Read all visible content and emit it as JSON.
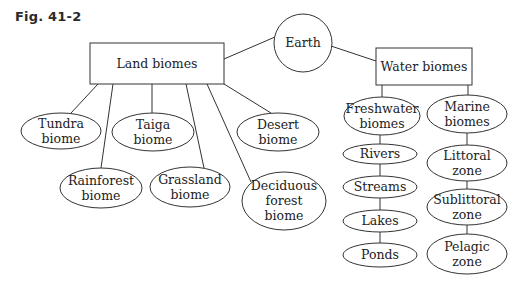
{
  "figure": {
    "label": "Fig. 41-2"
  },
  "diagram": {
    "colors": {
      "stroke": "#333333",
      "text": "#222222",
      "background": "#ffffff"
    },
    "nodes": [
      {
        "id": "earth",
        "shape": "circle",
        "lines": [
          "Earth"
        ],
        "cx": 303,
        "cy": 43,
        "r": 29
      },
      {
        "id": "land",
        "shape": "rect",
        "lines": [
          "Land biomes"
        ],
        "x": 90,
        "y": 43,
        "w": 134,
        "h": 41
      },
      {
        "id": "water",
        "shape": "rect",
        "lines": [
          "Water biomes"
        ],
        "x": 376,
        "y": 48,
        "w": 96,
        "h": 37
      },
      {
        "id": "tundra",
        "shape": "ellipse",
        "lines": [
          "Tundra",
          "biome"
        ],
        "cx": 61,
        "cy": 131,
        "rx": 40,
        "ry": 18
      },
      {
        "id": "taiga",
        "shape": "ellipse",
        "lines": [
          "Taiga",
          "biome"
        ],
        "cx": 153,
        "cy": 132,
        "rx": 41,
        "ry": 19
      },
      {
        "id": "desert",
        "shape": "ellipse",
        "lines": [
          "Desert",
          "biome"
        ],
        "cx": 278,
        "cy": 132,
        "rx": 41,
        "ry": 19
      },
      {
        "id": "rainforest",
        "shape": "ellipse",
        "lines": [
          "Rainforest",
          "biome"
        ],
        "cx": 101,
        "cy": 188,
        "rx": 41,
        "ry": 20
      },
      {
        "id": "grassland",
        "shape": "ellipse",
        "lines": [
          "Grassland",
          "biome"
        ],
        "cx": 190,
        "cy": 187,
        "rx": 40,
        "ry": 20
      },
      {
        "id": "deciduous",
        "shape": "ellipse",
        "lines": [
          "Deciduous",
          "forest",
          "biome"
        ],
        "cx": 284,
        "cy": 201,
        "rx": 42,
        "ry": 29
      },
      {
        "id": "freshwater",
        "shape": "ellipse",
        "lines": [
          "Freshwater",
          "biomes"
        ],
        "cx": 382,
        "cy": 116,
        "rx": 38,
        "ry": 19
      },
      {
        "id": "rivers",
        "shape": "ellipse",
        "lines": [
          "Rivers"
        ],
        "cx": 380,
        "cy": 154,
        "rx": 37,
        "ry": 10
      },
      {
        "id": "streams",
        "shape": "ellipse",
        "lines": [
          "Streams"
        ],
        "cx": 380,
        "cy": 187,
        "rx": 37,
        "ry": 11
      },
      {
        "id": "lakes",
        "shape": "ellipse",
        "lines": [
          "Lakes"
        ],
        "cx": 380,
        "cy": 221,
        "rx": 37,
        "ry": 11
      },
      {
        "id": "ponds",
        "shape": "ellipse",
        "lines": [
          "Ponds"
        ],
        "cx": 380,
        "cy": 255,
        "rx": 37,
        "ry": 12
      },
      {
        "id": "marine",
        "shape": "ellipse",
        "lines": [
          "Marine",
          "biomes"
        ],
        "cx": 467,
        "cy": 114,
        "rx": 40,
        "ry": 19
      },
      {
        "id": "littoral",
        "shape": "ellipse",
        "lines": [
          "Littoral",
          "zone"
        ],
        "cx": 467,
        "cy": 163,
        "rx": 40,
        "ry": 18
      },
      {
        "id": "sublittoral",
        "shape": "ellipse",
        "lines": [
          "Sublittoral",
          "zone"
        ],
        "cx": 467,
        "cy": 207,
        "rx": 40,
        "ry": 18
      },
      {
        "id": "pelagic",
        "shape": "ellipse",
        "lines": [
          "Pelagic",
          "zone"
        ],
        "cx": 467,
        "cy": 254,
        "rx": 40,
        "ry": 20
      }
    ],
    "edges": [
      {
        "from": "earth",
        "to": "land",
        "x1": 275,
        "y1": 37,
        "x2": 224,
        "y2": 59
      },
      {
        "from": "earth",
        "to": "water",
        "x1": 331,
        "y1": 46,
        "x2": 376,
        "y2": 61
      },
      {
        "from": "land",
        "to": "tundra",
        "x1": 98,
        "y1": 84,
        "x2": 71,
        "y2": 113
      },
      {
        "from": "land",
        "to": "rainforest",
        "x1": 113,
        "y1": 84,
        "x2": 101,
        "y2": 168
      },
      {
        "from": "land",
        "to": "taiga",
        "x1": 152,
        "y1": 84,
        "x2": 152,
        "y2": 113
      },
      {
        "from": "land",
        "to": "grassland",
        "x1": 186,
        "y1": 84,
        "x2": 204,
        "y2": 168
      },
      {
        "from": "land",
        "to": "deciduous",
        "x1": 207,
        "y1": 84,
        "x2": 251,
        "y2": 182
      },
      {
        "from": "land",
        "to": "desert",
        "x1": 224,
        "y1": 84,
        "x2": 271,
        "y2": 113
      },
      {
        "from": "water",
        "to": "freshwater",
        "x1": 382,
        "y1": 85,
        "x2": 382,
        "y2": 97
      },
      {
        "from": "water",
        "to": "marine",
        "x1": 468,
        "y1": 85,
        "x2": 468,
        "y2": 95
      },
      {
        "from": "freshwater",
        "to": "rivers",
        "x1": 380,
        "y1": 135,
        "x2": 380,
        "y2": 144
      },
      {
        "from": "rivers",
        "to": "streams",
        "x1": 380,
        "y1": 164,
        "x2": 380,
        "y2": 176
      },
      {
        "from": "streams",
        "to": "lakes",
        "x1": 380,
        "y1": 198,
        "x2": 380,
        "y2": 210
      },
      {
        "from": "lakes",
        "to": "ponds",
        "x1": 380,
        "y1": 232,
        "x2": 380,
        "y2": 243
      },
      {
        "from": "marine",
        "to": "littoral",
        "x1": 467,
        "y1": 133,
        "x2": 467,
        "y2": 145
      },
      {
        "from": "littoral",
        "to": "sublittoral",
        "x1": 467,
        "y1": 181,
        "x2": 467,
        "y2": 189
      },
      {
        "from": "sublittoral",
        "to": "pelagic",
        "x1": 467,
        "y1": 225,
        "x2": 467,
        "y2": 234
      }
    ]
  }
}
